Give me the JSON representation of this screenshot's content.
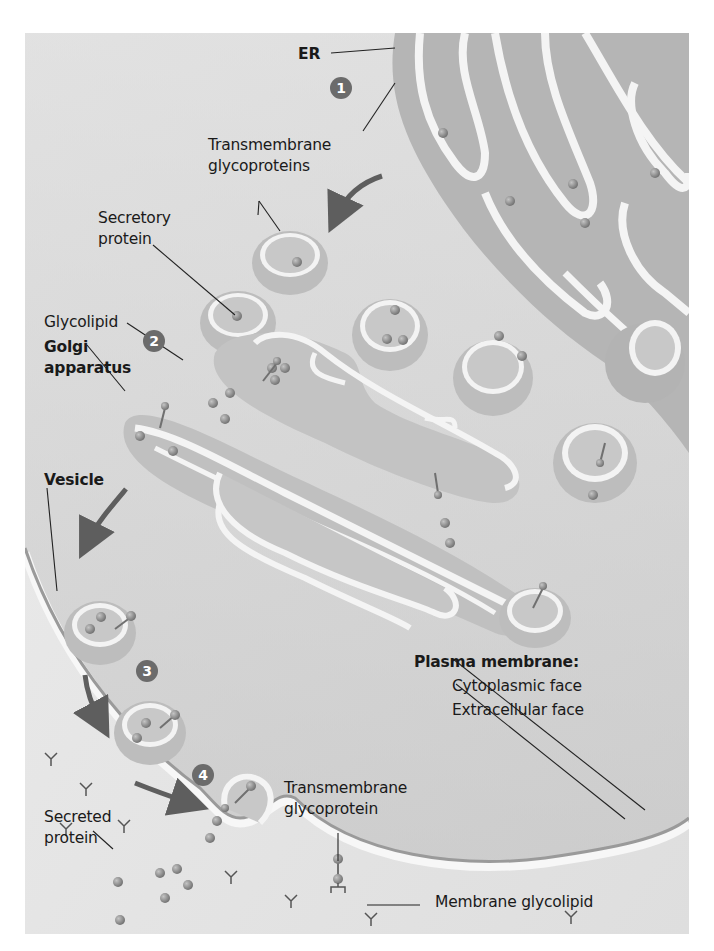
{
  "figure": {
    "background_color": "#e9e9e9",
    "organelle_color": "#b8b8b8",
    "lumen_color": "#c9c9c9",
    "membrane_highlight": "#f6f6f6",
    "protein_color": "#8c8c8c",
    "arrow_color": "#5e5e5e",
    "badge_color": "#6b6b6b"
  },
  "labels": {
    "er": "ER",
    "transmembrane_glycoproteins_line1": "Transmembrane",
    "transmembrane_glycoproteins_line2": "glycoproteins",
    "secretory_protein_line1": "Secretory",
    "secretory_protein_line2": "protein",
    "glycolipid": "Glycolipid",
    "golgi_line1": "Golgi",
    "golgi_line2": "apparatus",
    "vesicle": "Vesicle",
    "plasma_membrane": "Plasma membrane:",
    "cytoplasmic_face": "Cytoplasmic face",
    "extracellular_face": "Extracellular face",
    "transmembrane_glycoprotein_line1": "Transmembrane",
    "transmembrane_glycoprotein_line2": "glycoprotein",
    "secreted_protein_line1": "Secreted",
    "secreted_protein_line2": "protein",
    "membrane_glycolipid": "Membrane glycolipid"
  },
  "steps": [
    {
      "number": "1"
    },
    {
      "number": "2"
    },
    {
      "number": "3"
    },
    {
      "number": "4"
    }
  ]
}
